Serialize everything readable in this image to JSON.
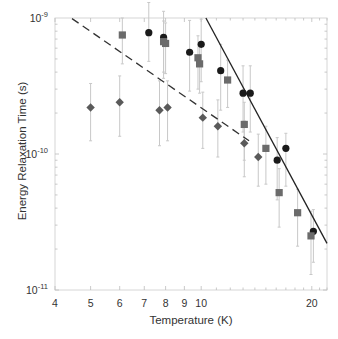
{
  "chart_data": {
    "type": "scatter",
    "title": "",
    "xlabel": "Temperature (K)",
    "ylabel": "Energy Relaxation Time (s)",
    "xscale": "log",
    "yscale": "log",
    "xlim": [
      4,
      22
    ],
    "ylim": [
      1e-11,
      1e-09
    ],
    "grid": false,
    "legend": null,
    "x_ticks": [
      4,
      5,
      6,
      7,
      8,
      9,
      10,
      20
    ],
    "x_tick_labels": [
      "4",
      "5",
      "6",
      "7",
      "8",
      "9",
      "10",
      "20"
    ],
    "y_ticks": [
      1e-11,
      1e-10,
      1e-09
    ],
    "y_tick_labels": [
      {
        "base": "10",
        "exp": "-11"
      },
      {
        "base": "10",
        "exp": "-10"
      },
      {
        "base": "10",
        "exp": "-9"
      }
    ],
    "series": [
      {
        "name": "circles",
        "marker": "circle",
        "color": "#1a1a1a",
        "x": [
          7.2,
          7.9,
          9.3,
          10.0,
          11.3,
          13.0,
          13.6,
          16.1,
          17.0,
          20.2
        ],
        "y": [
          7.8e-10,
          7.2e-10,
          5.6e-10,
          6.4e-10,
          4.1e-10,
          2.8e-10,
          2.8e-10,
          9e-11,
          1.1e-10,
          2.7e-11
        ],
        "err_lo": [
          4.8e-10,
          3.6e-10,
          2.9e-10,
          3.4e-10,
          2.1e-10,
          1.45e-10,
          1.45e-10,
          4.6e-11,
          5.8e-11,
          1.6e-11
        ],
        "err_hi": [
          1.3e-09,
          1.12e-09,
          9.6e-10,
          9.8e-10,
          6.4e-10,
          4.45e-10,
          4.45e-10,
          1.32e-10,
          1.42e-10,
          3.9e-11
        ]
      },
      {
        "name": "squares",
        "marker": "square",
        "color": "#6b6b6b",
        "x": [
          6.1,
          7.9,
          8.0,
          9.8,
          9.9,
          11.8,
          13.1,
          15.0,
          16.3,
          18.3,
          19.9
        ],
        "y": [
          7.5e-10,
          6.7e-10,
          6.5e-10,
          5.1e-10,
          4.6e-10,
          3.5e-10,
          1.65e-10,
          1.1e-10,
          5.2e-11,
          3.7e-11,
          2.5e-11
        ],
        "err_lo": [
          4.6e-10,
          4e-10,
          3.9e-10,
          3e-10,
          2.8e-10,
          2.2e-10,
          9e-11,
          6e-11,
          2.9e-11,
          2.1e-11,
          1.3e-11
        ],
        "err_hi": [
          1e-09,
          9.5e-10,
          9.2e-10,
          7.4e-10,
          6.6e-10,
          4.9e-10,
          2.4e-10,
          1.6e-10,
          7.8e-11,
          5.5e-11,
          3.8e-11
        ]
      },
      {
        "name": "diamonds",
        "marker": "diamond",
        "color": "#5a5a5a",
        "x": [
          5.0,
          6.0,
          7.7,
          8.1,
          10.1,
          11.1,
          13.1,
          14.3
        ],
        "y": [
          2.2e-10,
          2.4e-10,
          2.1e-10,
          2.2e-10,
          1.85e-10,
          1.6e-10,
          1.2e-10,
          9.5e-11
        ],
        "err_lo": [
          1.25e-10,
          1.35e-10,
          1.15e-10,
          1.25e-10,
          1.1e-10,
          9.5e-11,
          6.8e-11,
          5.8e-11
        ],
        "err_hi": [
          3.3e-10,
          3.75e-10,
          3.45e-10,
          3.45e-10,
          2.85e-10,
          2.5e-10,
          1.75e-10,
          1.4e-10
        ]
      }
    ],
    "fit_lines": [
      {
        "name": "dashed-fit",
        "style": "dashed",
        "color": "#333333",
        "x": [
          4.45,
          13.5
        ],
        "y": [
          9.9e-10,
          1.25e-10
        ]
      },
      {
        "name": "solid-fit",
        "style": "solid",
        "color": "#222222",
        "x": [
          10.3,
          22.0
        ],
        "y": [
          1e-09,
          2.2e-11
        ]
      }
    ]
  }
}
